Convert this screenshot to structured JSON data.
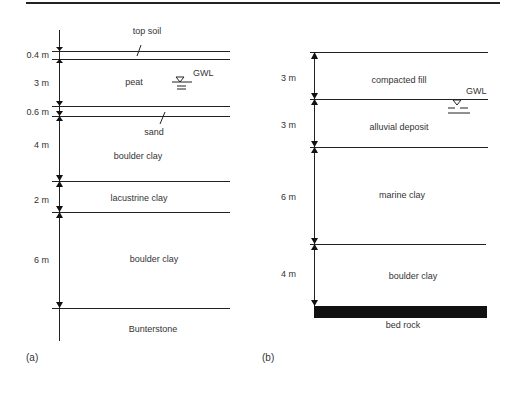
{
  "figure": {
    "top_rule": true,
    "panels": [
      {
        "id": "a",
        "caption": "(a)",
        "layers": [
          {
            "name": "top soil",
            "thickness": "0.4 m"
          },
          {
            "name": "peat",
            "thickness": "3 m"
          },
          {
            "name": "sand",
            "thickness": "0.6 m"
          },
          {
            "name": "boulder clay",
            "thickness": "4 m"
          },
          {
            "name": "lacustrine clay",
            "thickness": "2 m"
          },
          {
            "name": "boulder clay",
            "thickness": "6 m"
          },
          {
            "name": "Bunterstone",
            "thickness": ""
          }
        ],
        "gwl_label": "GWL",
        "gwl_layer": "peat"
      },
      {
        "id": "b",
        "caption": "(b)",
        "layers": [
          {
            "name": "compacted fill",
            "thickness": "3 m"
          },
          {
            "name": "alluvial deposit",
            "thickness": "3 m"
          },
          {
            "name": "marine clay",
            "thickness": "6 m"
          },
          {
            "name": "boulder clay",
            "thickness": "4 m"
          },
          {
            "name": "bed rock",
            "thickness": ""
          }
        ],
        "gwl_label": "GWL",
        "gwl_layer": "boundary compacted fill / alluvial deposit"
      }
    ]
  },
  "colors": {
    "ink": "#222222",
    "background": "#ffffff"
  }
}
